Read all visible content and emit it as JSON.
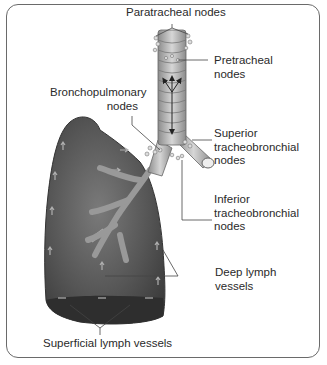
{
  "diagram": {
    "labels": {
      "paratracheal": "Paratracheal nodes",
      "pretracheal": "Pretracheal\nnodes",
      "bronchopulmonary": "Bronchopulmonary\nnodes",
      "superior_tb": "Superior\ntracheobronchial\nnodes",
      "inferior_tb": "Inferior\ntracheobronchial\nnodes",
      "deep_lymph": "Deep lymph\nvessels",
      "superficial_lymph": "Superficial lymph vessels"
    },
    "colors": {
      "lung": "#5a5a5a",
      "lung_base": "#2e2e2e",
      "trachea": "#b8b8b8",
      "frame": "#6a6a6a",
      "leader_line": "#444444"
    }
  }
}
